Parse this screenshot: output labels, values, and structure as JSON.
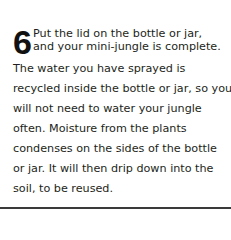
{
  "step": {
    "number": "6",
    "lead_lines": [
      "Put the lid on the bottle or jar,",
      "and your mini-jungle is complete."
    ],
    "body_lines": [
      "The water you have sprayed is",
      "recycled inside the bottle or jar, so you",
      "will not need to water your jungle",
      "often. Moisture from the plants",
      "condenses on the sides of the bottle",
      "or jar. It will then drip down into the",
      "soil, to be reused."
    ]
  },
  "colors": {
    "text": "#231f20",
    "rule": "#3a3a3a",
    "background": "#ffffff"
  }
}
